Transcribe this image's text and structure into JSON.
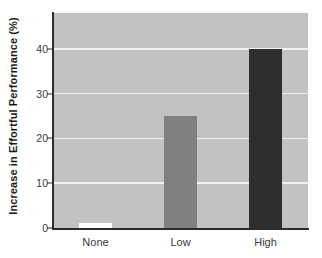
{
  "chart_data": {
    "type": "bar",
    "title": "",
    "subtitle": "",
    "xlabel": "",
    "ylabel": "Increase in Effortful Performance (%)",
    "categories": [
      "None",
      "Low",
      "High"
    ],
    "values": [
      1.2,
      25,
      40
    ],
    "series": [
      {
        "name": "Increase in Effortful Performance",
        "values": [
          1.2,
          25,
          40
        ]
      }
    ],
    "bar_colors": [
      "#ffffff",
      "#808080",
      "#2e2e2e"
    ],
    "ylim": [
      0,
      48
    ],
    "yticks": [
      0,
      10,
      20,
      30,
      40
    ],
    "ytick_labels": [
      "0",
      "10",
      "20",
      "30",
      "40"
    ],
    "xtick_labels": [
      "None",
      "Low",
      "High"
    ],
    "grid": true,
    "grid_axis": "y",
    "grid_color": "#f2f2f2",
    "legend": false,
    "legend_position": "none",
    "plot_background": "#c2c2c2",
    "figure_background": "#ffffff",
    "axis_color": "#2b2b2b",
    "annotations": []
  }
}
